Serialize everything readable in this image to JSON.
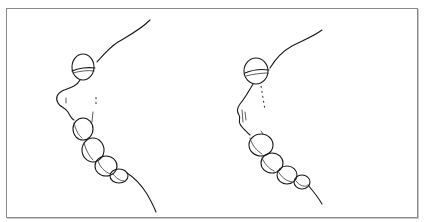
{
  "figure": {
    "type": "line-drawing",
    "panels": [
      {
        "id": "left",
        "label": ""
      },
      {
        "id": "right",
        "label": ""
      }
    ],
    "colors": {
      "ink": "#1a1a1a",
      "background": "#ffffff",
      "border": "#8a8a8a"
    }
  }
}
